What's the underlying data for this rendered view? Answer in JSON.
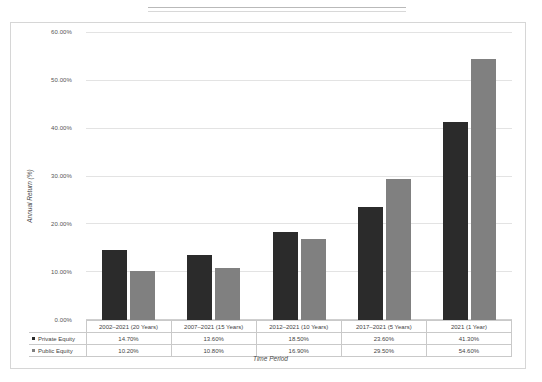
{
  "chart_data": {
    "type": "bar",
    "title": "",
    "xlabel": "Time Period",
    "ylabel": "Annual Return (%)",
    "ylim": [
      0,
      60
    ],
    "ytick_labels": [
      "0.00%",
      "10.00%",
      "20.00%",
      "30.00%",
      "40.00%",
      "50.00%",
      "60.00%"
    ],
    "ytick_values": [
      0,
      10,
      20,
      30,
      40,
      50,
      60
    ],
    "grid": true,
    "legend_position": "table-left",
    "categories": [
      "2002–2021 (20 Years)",
      "2007–2021 (15 Years)",
      "2012–2021 (10 Years)",
      "2017–2021 (5 Years)",
      "2021 (1 Year)"
    ],
    "series": [
      {
        "name": "Private Equity",
        "color": "#2b2b2b",
        "values": [
          14.7,
          13.6,
          18.5,
          23.6,
          41.3
        ],
        "labels": [
          "14.70%",
          "13.60%",
          "18.50%",
          "23.60%",
          "41.30%"
        ]
      },
      {
        "name": "Public Equity",
        "color": "#808080",
        "values": [
          10.2,
          10.8,
          16.9,
          29.5,
          54.6
        ],
        "labels": [
          "10.20%",
          "10.80%",
          "16.90%",
          "29.50%",
          "54.60%"
        ]
      }
    ]
  },
  "colors": {
    "private_equity": "#2b2b2b",
    "public_equity": "#808080",
    "gridline": "#e3e3e3",
    "frame": "#d6d6d6",
    "table_border": "#c9c9c9"
  }
}
